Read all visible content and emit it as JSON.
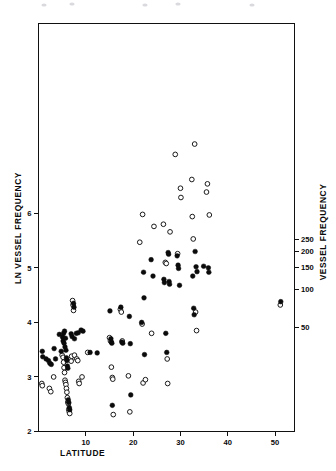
{
  "figure": {
    "background_color": "#ffffff",
    "frame_color": "#111111"
  },
  "axes": {
    "x": {
      "label": "LATITUDE",
      "ticks": [
        "10",
        "20",
        "30",
        "40",
        "50"
      ],
      "tick_values": [
        10,
        20,
        30,
        40,
        50
      ],
      "range": [
        0,
        54.1
      ]
    },
    "y_left": {
      "label": "LN VESSEL FREQUENCY",
      "ticks": [
        "2",
        "3",
        "4",
        "5",
        "6"
      ],
      "tick_values": [
        2,
        3,
        4,
        5,
        6
      ],
      "range": [
        2,
        9.48
      ]
    },
    "y_right": {
      "label": "VESSEL FREQUENCY",
      "ticks": [
        "50",
        "100",
        "150",
        "200",
        "250"
      ],
      "tick_values": [
        50,
        100,
        150,
        200,
        250
      ]
    }
  },
  "series_style": {
    "filled_color": "#0b0b0b",
    "open_stroke_color": "#1a1a1a",
    "open_fill_color": "#ffffff",
    "marker_radius": 2.35
  },
  "chart_data": {
    "type": "scatter",
    "title": "",
    "xlabel": "LATITUDE",
    "ylabel": "LN VESSEL FREQUENCY",
    "y2label": "VESSEL FREQUENCY",
    "xlim": [
      0,
      54.1
    ],
    "ylim": [
      2,
      9.48
    ],
    "y2_ticks": [
      50,
      100,
      150,
      200,
      250
    ],
    "y2_mapping": "y2 = exp(y_left)",
    "grid": false,
    "legend": "none",
    "series": [
      {
        "name": "filled",
        "marker": "filled-circle",
        "color": "#0b0b0b",
        "points": [
          [
            0.8,
            3.47
          ],
          [
            0.9,
            3.37
          ],
          [
            1.6,
            3.33
          ],
          [
            2.1,
            3.3
          ],
          [
            2.4,
            3.25
          ],
          [
            2.7,
            3.23
          ],
          [
            3.3,
            3.52
          ],
          [
            3.6,
            3.33
          ],
          [
            4.4,
            3.78
          ],
          [
            4.8,
            3.47
          ],
          [
            5.1,
            3.73
          ],
          [
            5.2,
            3.66
          ],
          [
            5.3,
            3.8
          ],
          [
            5.4,
            3.62
          ],
          [
            5.5,
            3.84
          ],
          [
            5.6,
            3.55
          ],
          [
            5.7,
            3.71
          ],
          [
            5.8,
            3.49
          ],
          [
            5.9,
            3.35
          ],
          [
            6.0,
            3.3
          ],
          [
            6.1,
            3.2
          ],
          [
            6.2,
            3.16
          ],
          [
            6.3,
            2.58
          ],
          [
            6.4,
            2.53
          ],
          [
            6.5,
            2.44
          ],
          [
            6.6,
            2.4
          ],
          [
            6.9,
            3.79
          ],
          [
            7.1,
            3.74
          ],
          [
            7.4,
            4.35
          ],
          [
            7.5,
            4.28
          ],
          [
            7.6,
            3.7
          ],
          [
            8.0,
            3.8
          ],
          [
            8.4,
            3.81
          ],
          [
            9.0,
            3.86
          ],
          [
            9.4,
            3.84
          ],
          [
            10.9,
            3.45
          ],
          [
            12.4,
            3.44
          ],
          [
            15.1,
            4.21
          ],
          [
            15.3,
            3.7
          ],
          [
            15.4,
            3.64
          ],
          [
            15.5,
            3.62
          ],
          [
            15.6,
            2.48
          ],
          [
            17.4,
            4.28
          ],
          [
            17.6,
            3.64
          ],
          [
            17.8,
            3.62
          ],
          [
            19.2,
            4.11
          ],
          [
            19.4,
            3.61
          ],
          [
            19.5,
            2.67
          ],
          [
            21.8,
            4.0
          ],
          [
            22.2,
            4.92
          ],
          [
            22.3,
            4.45
          ],
          [
            22.4,
            3.41
          ],
          [
            23.8,
            5.15
          ],
          [
            24.2,
            4.85
          ],
          [
            26.5,
            4.79
          ],
          [
            26.6,
            4.73
          ],
          [
            26.9,
            3.8
          ],
          [
            27.1,
            3.45
          ],
          [
            27.4,
            5.28
          ],
          [
            27.5,
            5.25
          ],
          [
            27.6,
            4.75
          ],
          [
            27.7,
            4.7
          ],
          [
            29.3,
            5.22
          ],
          [
            29.5,
            5.05
          ],
          [
            29.6,
            4.99
          ],
          [
            29.8,
            4.68
          ],
          [
            32.6,
            4.85
          ],
          [
            32.8,
            4.26
          ],
          [
            32.9,
            4.14
          ],
          [
            33.1,
            5.3
          ],
          [
            33.3,
            5.02
          ],
          [
            33.5,
            4.93
          ],
          [
            34.9,
            5.03
          ],
          [
            35.9,
            5.0
          ],
          [
            36.0,
            4.92
          ],
          [
            51.2,
            4.38
          ]
        ]
      },
      {
        "name": "open",
        "marker": "open-circle",
        "color": "#1a1a1a",
        "points": [
          [
            0.7,
            2.88
          ],
          [
            0.8,
            2.84
          ],
          [
            2.3,
            2.79
          ],
          [
            2.6,
            2.73
          ],
          [
            3.2,
            3.0
          ],
          [
            5.0,
            3.4
          ],
          [
            5.2,
            3.36
          ],
          [
            5.3,
            3.27
          ],
          [
            5.4,
            3.17
          ],
          [
            5.5,
            3.08
          ],
          [
            5.6,
            2.94
          ],
          [
            5.7,
            2.9
          ],
          [
            5.8,
            2.86
          ],
          [
            5.9,
            2.79
          ],
          [
            6.0,
            2.72
          ],
          [
            6.1,
            2.62
          ],
          [
            6.2,
            2.54
          ],
          [
            6.3,
            2.51
          ],
          [
            6.4,
            2.4
          ],
          [
            6.5,
            2.36
          ],
          [
            6.6,
            2.33
          ],
          [
            6.8,
            3.32
          ],
          [
            6.9,
            3.29
          ],
          [
            7.0,
            3.38
          ],
          [
            7.2,
            4.4
          ],
          [
            7.3,
            4.32
          ],
          [
            7.4,
            4.22
          ],
          [
            7.6,
            3.4
          ],
          [
            8.1,
            3.33
          ],
          [
            8.3,
            3.3
          ],
          [
            8.5,
            2.92
          ],
          [
            8.6,
            2.88
          ],
          [
            9.2,
            3.0
          ],
          [
            10.4,
            3.45
          ],
          [
            15.0,
            3.72
          ],
          [
            15.2,
            3.66
          ],
          [
            15.4,
            3.18
          ],
          [
            15.6,
            2.99
          ],
          [
            15.7,
            2.96
          ],
          [
            15.8,
            2.31
          ],
          [
            17.3,
            4.24
          ],
          [
            17.5,
            4.19
          ],
          [
            17.7,
            3.66
          ],
          [
            19.0,
            3.02
          ],
          [
            19.3,
            2.36
          ],
          [
            21.4,
            5.47
          ],
          [
            21.9,
            3.97
          ],
          [
            22.0,
            5.98
          ],
          [
            22.1,
            2.89
          ],
          [
            22.6,
            2.95
          ],
          [
            23.9,
            3.8
          ],
          [
            24.4,
            5.76
          ],
          [
            26.4,
            5.8
          ],
          [
            26.8,
            5.1
          ],
          [
            27.0,
            5.08
          ],
          [
            27.2,
            3.33
          ],
          [
            27.3,
            2.88
          ],
          [
            27.8,
            5.66
          ],
          [
            28.9,
            7.08
          ],
          [
            29.4,
            5.26
          ],
          [
            30.0,
            6.46
          ],
          [
            30.1,
            6.29
          ],
          [
            32.4,
            6.62
          ],
          [
            32.5,
            5.94
          ],
          [
            32.7,
            5.53
          ],
          [
            33.0,
            7.27
          ],
          [
            33.2,
            4.19
          ],
          [
            33.4,
            3.85
          ],
          [
            35.5,
            6.39
          ],
          [
            35.7,
            6.54
          ],
          [
            36.1,
            5.97
          ],
          [
            51.1,
            4.32
          ]
        ]
      }
    ]
  },
  "annotations": {
    "top_specks": [
      {
        "x": 44,
        "y": 5
      },
      {
        "x": 72,
        "y": 4
      },
      {
        "x": 145,
        "y": 5
      },
      {
        "x": 178,
        "y": 4
      },
      {
        "x": 252,
        "y": 5
      }
    ]
  }
}
